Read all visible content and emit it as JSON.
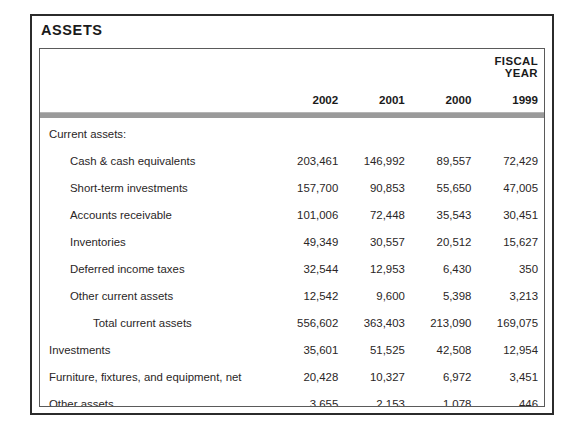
{
  "section": {
    "title": "ASSETS"
  },
  "table": {
    "fiscal_year_label": "FISCAL YEAR",
    "year_columns": [
      "2002",
      "2001",
      "2000",
      "1999"
    ],
    "rows": [
      {
        "label": "Current assets:",
        "indent": 0,
        "values": [
          "",
          "",
          "",
          ""
        ]
      },
      {
        "label": "Cash & cash equivalents",
        "indent": 1,
        "values": [
          "203,461",
          "146,992",
          "89,557",
          "72,429"
        ]
      },
      {
        "label": "Short-term investments",
        "indent": 1,
        "values": [
          "157,700",
          "90,853",
          "55,650",
          "47,005"
        ]
      },
      {
        "label": "Accounts receivable",
        "indent": 1,
        "values": [
          "101,006",
          "72,448",
          "35,543",
          "30,451"
        ]
      },
      {
        "label": "Inventories",
        "indent": 1,
        "values": [
          "49,349",
          "30,557",
          "20,512",
          "15,627"
        ]
      },
      {
        "label": "Deferred income taxes",
        "indent": 1,
        "values": [
          "32,544",
          "12,953",
          "6,430",
          "350"
        ]
      },
      {
        "label": "Other current assets",
        "indent": 1,
        "values": [
          "12,542",
          "9,600",
          "5,398",
          "3,213"
        ]
      },
      {
        "label": "Total current assets",
        "indent": 2,
        "values": [
          "556,602",
          "363,403",
          "213,090",
          "169,075"
        ]
      },
      {
        "label": "Investments",
        "indent": 0,
        "values": [
          "35,601",
          "51,525",
          "42,508",
          "12,954"
        ]
      },
      {
        "label": "Furniture, fixtures, and equipment, net",
        "indent": 0,
        "values": [
          "20,428",
          "10,327",
          "6,972",
          "3,451"
        ]
      },
      {
        "label": "Other assets",
        "indent": 0,
        "values": [
          "3,655",
          "2,153",
          "1,078",
          "446"
        ]
      },
      {
        "label": "Total assets",
        "indent": 2,
        "values": [
          "616,286",
          "427,408",
          "263,648",
          "185,921"
        ]
      }
    ]
  },
  "colors": {
    "border": "#2b2b2b",
    "inner_border": "#5a5a5a",
    "rule": "#9a9a9a",
    "text": "#2a2626",
    "heading_text": "#1a1a1a",
    "background": "#ffffff"
  }
}
